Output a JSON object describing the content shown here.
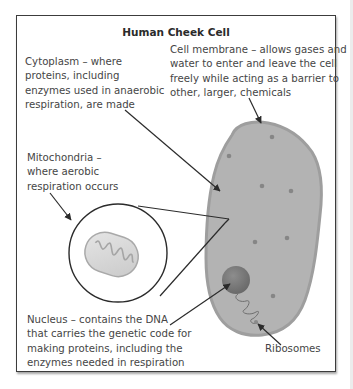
{
  "diagram": {
    "title": "Human Cheek Cell",
    "labels": {
      "cytoplasm": "Cytoplasm – where\nproteins, including\nenzymes used in anaerobic\nrespiration, are made",
      "cell_membrane": "Cell membrane – allows gases and\nwater to enter and leave the cell\nfreely while acting as a barrier to\nother, larger, chemicals",
      "mitochondria": "Mitochondria –\nwhere aerobic\nrespiration occurs",
      "nucleus": "Nucleus – contains the DNA\nthat carries the genetic code for\nmaking proteins, including the\nenzymes needed in respiration",
      "ribosomes": "Ribosomes"
    },
    "colors": {
      "cell_fill": "#b3b3b3",
      "membrane": "#9e9e9e",
      "nucleus": "#7b7b7b",
      "dots": "#868686",
      "frame": "#3c3c3c"
    }
  }
}
